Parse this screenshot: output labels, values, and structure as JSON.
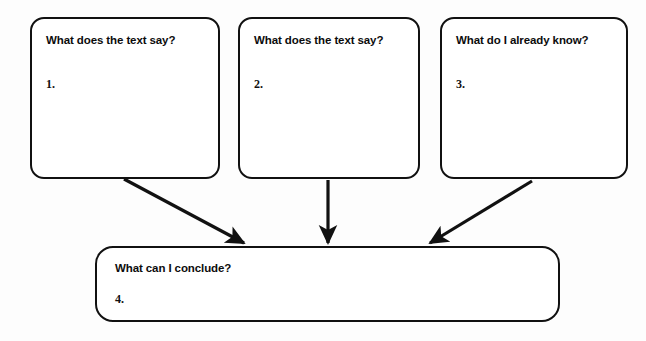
{
  "diagram": {
    "background_color": "#fdfdfd",
    "line_color": "#111111",
    "boxes": [
      {
        "id": "box-1",
        "heading": "What does the text say?",
        "number": "1."
      },
      {
        "id": "box-2",
        "heading": "What does the text say?",
        "number": "2."
      },
      {
        "id": "box-3",
        "heading": "What do I already know?",
        "number": "3."
      },
      {
        "id": "box-4",
        "heading": "What can I conclude?",
        "number": "4."
      }
    ],
    "arrows": [
      {
        "id": "arrow-1",
        "from": "box-1",
        "to": "box-4",
        "direction": "diagonal-down-right"
      },
      {
        "id": "arrow-2",
        "from": "box-2",
        "to": "box-4",
        "direction": "straight-down"
      },
      {
        "id": "arrow-3",
        "from": "box-3",
        "to": "box-4",
        "direction": "diagonal-down-left"
      }
    ]
  }
}
